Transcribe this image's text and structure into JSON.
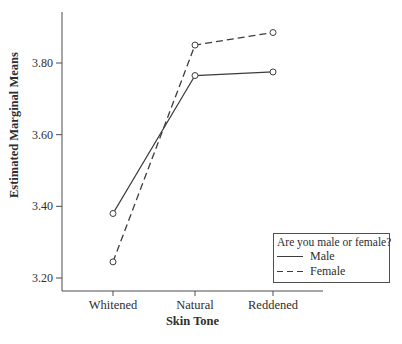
{
  "chart_data": {
    "type": "line",
    "title": "",
    "xlabel": "Skin Tone",
    "ylabel": "Estimated Marginal Means",
    "categories": [
      "Whitened",
      "Natural",
      "Reddened"
    ],
    "series": [
      {
        "name": "Male",
        "style": "solid",
        "marker": "open-circle",
        "values": [
          3.38,
          3.765,
          3.775
        ]
      },
      {
        "name": "Female",
        "style": "dashed",
        "marker": "open-circle",
        "values": [
          3.245,
          3.85,
          3.885
        ]
      }
    ],
    "y_ticks": [
      3.8,
      3.6,
      3.4,
      3.2
    ],
    "y_tick_labels": [
      "3.80",
      "3.60",
      "3.40",
      "3.20"
    ],
    "ylim": [
      3.16,
      3.94
    ],
    "grid": false,
    "legend": {
      "title": "Are you male or female?",
      "position": "bottom-right",
      "entries": [
        {
          "label": "Male",
          "line": "solid"
        },
        {
          "label": "Female",
          "line": "dashed"
        }
      ]
    },
    "colors": {
      "line": "#3c3c3c",
      "axis": "#4d4d4d",
      "text": "#2e2e2e",
      "marker_fill": "#ffffff"
    }
  }
}
